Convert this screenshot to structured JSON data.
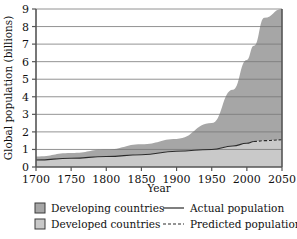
{
  "chart_data": {
    "type": "area",
    "title": "",
    "xlabel": "Year",
    "ylabel": "Global population (billions)",
    "xlim": [
      1700,
      2050
    ],
    "ylim": [
      0,
      9
    ],
    "xticks": [
      1700,
      1750,
      1800,
      1850,
      1900,
      1950,
      2000,
      2050
    ],
    "yticks": [
      0,
      1,
      2,
      3,
      4,
      5,
      6,
      7,
      8,
      9
    ],
    "grid": "horizontal",
    "legend_position": "below",
    "prediction_starts": 2010,
    "stacked": true,
    "x": [
      1700,
      1750,
      1800,
      1850,
      1900,
      1950,
      1980,
      2000,
      2010,
      2025,
      2050
    ],
    "series": [
      {
        "name": "Developed countries",
        "color": "#c9c9c9",
        "values": [
          0.4,
          0.5,
          0.6,
          0.7,
          0.9,
          1.0,
          1.2,
          1.35,
          1.45,
          1.5,
          1.55
        ]
      },
      {
        "name": "Developing countries",
        "color": "#a6a6a6",
        "values": [
          0.2,
          0.3,
          0.4,
          0.6,
          0.7,
          1.5,
          3.2,
          4.75,
          5.45,
          7.0,
          7.45
        ]
      }
    ],
    "totals": [
      0.6,
      0.8,
      1.0,
      1.3,
      1.6,
      2.5,
      4.4,
      6.1,
      6.9,
      8.5,
      9.0
    ],
    "annotations": []
  },
  "axes": {
    "y_tick_labels": [
      "9",
      "8",
      "7",
      "6",
      "5",
      "4",
      "3",
      "2",
      "1",
      "0"
    ],
    "x_tick_labels": [
      "1700",
      "1750",
      "1800",
      "1850",
      "1900",
      "1950",
      "2000",
      "2050"
    ],
    "x_axis_title": "Year",
    "y_axis_title": "Global population (billions)"
  },
  "legend": {
    "swatch_entries": [
      {
        "label": "Developing countries",
        "color": "#a6a6a6",
        "swatch": "filled-square-dark"
      },
      {
        "label": "Developed countries",
        "color": "#c9c9c9",
        "swatch": "filled-square-light"
      }
    ],
    "line_entries": [
      {
        "label": "Actual population",
        "style": "solid",
        "color": "#2a2a2a"
      },
      {
        "label": "Predicted population",
        "style": "dashed",
        "color": "#2a2a2a"
      }
    ]
  },
  "colors": {
    "developing": "#a6a6a6",
    "developed": "#c9c9c9",
    "axis": "#555555",
    "gridline": "#777777",
    "line": "#2a2a2a",
    "background": "#ffffff"
  }
}
